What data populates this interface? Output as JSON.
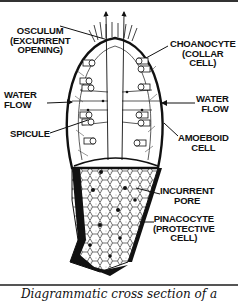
{
  "diagram": {
    "labels": {
      "osculum": [
        "OSCULUM",
        "(EXCURRENT",
        "OPENING)"
      ],
      "choanocyte": [
        "CHOANOCYTE",
        "(COLLAR",
        "CELL)"
      ],
      "water_flow_left": [
        "WATER",
        "FLOW"
      ],
      "water_flow_right": [
        "WATER",
        "FLOW"
      ],
      "spicule": [
        "SPICULE"
      ],
      "amoeboid": [
        "AMOEBOID",
        "CELL"
      ],
      "incurrent_pore": [
        "INCURRENT",
        "PORE"
      ],
      "pinacocyte": [
        "PINACOCYTE",
        "(PROTECTIVE",
        "CELL)"
      ]
    },
    "colors": {
      "ink": "#111111",
      "background": "#ffffff"
    }
  },
  "caption": "Diagrammatic cross section of a"
}
